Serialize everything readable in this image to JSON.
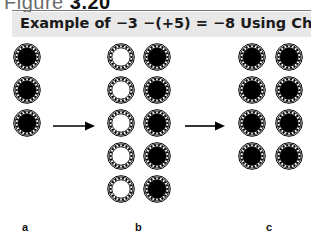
{
  "figure": {
    "label_prefix": "Figure",
    "label_number": "3.20"
  },
  "title": "Example of −3 −(+5) = −8 Using Chips",
  "panels": [
    {
      "id": "a",
      "label": "a",
      "chips": [
        {
          "type": "black",
          "x": 13,
          "y": 43
        },
        {
          "type": "black",
          "x": 13,
          "y": 76
        },
        {
          "type": "black",
          "x": 13,
          "y": 109
        }
      ]
    },
    {
      "id": "b",
      "label": "b",
      "chips": [
        {
          "type": "white",
          "x": 107,
          "y": 43
        },
        {
          "type": "white",
          "x": 107,
          "y": 76
        },
        {
          "type": "white",
          "x": 107,
          "y": 109
        },
        {
          "type": "white",
          "x": 107,
          "y": 142
        },
        {
          "type": "white",
          "x": 107,
          "y": 175
        },
        {
          "type": "black",
          "x": 143,
          "y": 43
        },
        {
          "type": "black",
          "x": 143,
          "y": 76
        },
        {
          "type": "black",
          "x": 143,
          "y": 109
        },
        {
          "type": "black",
          "x": 143,
          "y": 142
        },
        {
          "type": "black",
          "x": 143,
          "y": 175
        }
      ]
    },
    {
      "id": "c",
      "label": "c",
      "chips": [
        {
          "type": "black",
          "x": 238,
          "y": 43
        },
        {
          "type": "black",
          "x": 238,
          "y": 76
        },
        {
          "type": "black",
          "x": 238,
          "y": 109
        },
        {
          "type": "black",
          "x": 238,
          "y": 142
        },
        {
          "type": "black",
          "x": 275,
          "y": 43
        },
        {
          "type": "black",
          "x": 275,
          "y": 76
        },
        {
          "type": "black",
          "x": 275,
          "y": 109
        },
        {
          "type": "black",
          "x": 275,
          "y": 142
        }
      ]
    }
  ],
  "arrows": [
    {
      "from": "a",
      "to": "b",
      "x1": 53,
      "x2": 95,
      "y": 123
    },
    {
      "from": "b",
      "to": "c",
      "x1": 185,
      "x2": 225,
      "y": 123
    }
  ],
  "colors": {
    "title_bg": "#e8e8e8",
    "chip_black": "#000000",
    "chip_white": "#ffffff"
  }
}
